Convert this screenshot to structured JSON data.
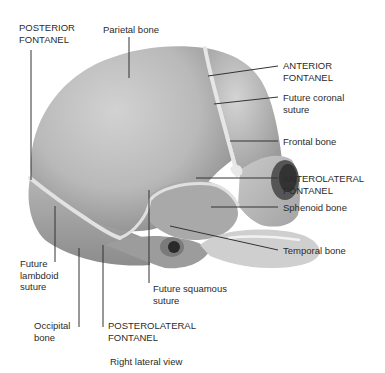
{
  "diagram": {
    "caption": "Right lateral view",
    "labels": [
      {
        "id": "posterior-fontanel",
        "text": "POSTERIOR\nFONTANEL"
      },
      {
        "id": "parietal-bone",
        "text": "Parietal bone"
      },
      {
        "id": "anterior-fontanel",
        "text": "ANTERIOR\nFONTANEL"
      },
      {
        "id": "future-coronal-suture",
        "text": "Future coronal\nsuture"
      },
      {
        "id": "frontal-bone",
        "text": "Frontal bone"
      },
      {
        "id": "anterolateral-fontanel",
        "text": "ANTEROLATERAL\nFONTANEL"
      },
      {
        "id": "sphenoid-bone",
        "text": "Sphenoid bone"
      },
      {
        "id": "temporal-bone",
        "text": "Temporal bone"
      },
      {
        "id": "future-lambdoid-suture",
        "text": "Future\nlambdoid\nsuture"
      },
      {
        "id": "future-squamous-suture",
        "text": "Future squamous\nsuture"
      },
      {
        "id": "occipital-bone",
        "text": "Occipital\nbone"
      },
      {
        "id": "posterolateral-fontanel",
        "text": "POSTEROLATERAL\nFONTANEL"
      }
    ],
    "colors": {
      "bone": "#b8b8b8",
      "bone_light": "#d6d6d6",
      "bone_dark": "#8a8a8a",
      "suture": "#e4e4e4",
      "leader": "#333333",
      "text": "#2b2b2b"
    }
  }
}
